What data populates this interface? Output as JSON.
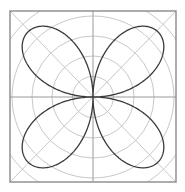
{
  "figure": {
    "equation": "r = |sin(2θ)|",
    "colors": {
      "background": "#ffffff",
      "grid": "#c8c8c8",
      "frame": "#8a8a8a",
      "axes": "#9a9a9a",
      "curve": "#3a3a3a"
    },
    "center": [
      93,
      97
    ],
    "frame": {
      "x": 10,
      "y": 11,
      "width": 166,
      "height": 171
    },
    "ring_radii": [
      20.5,
      41,
      61,
      81,
      101
    ],
    "rose": {
      "petals": 4,
      "amplitude": 92,
      "k": 2,
      "orientation_deg": 45
    }
  }
}
